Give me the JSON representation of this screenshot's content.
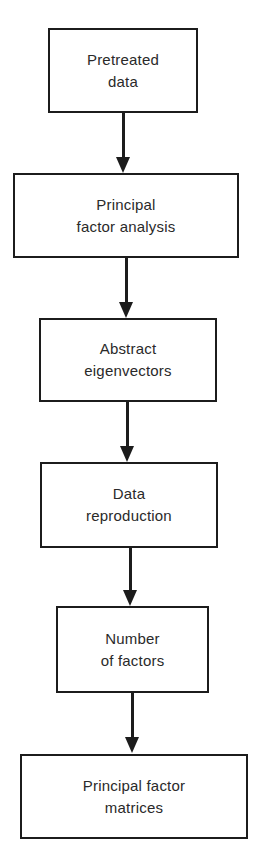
{
  "diagram": {
    "type": "flowchart",
    "direction": "top-to-bottom",
    "colors": {
      "stroke": "#1c1c1c",
      "text": "#2a2a2a",
      "background": "#ffffff"
    },
    "nodes": [
      {
        "id": "pretreated-data",
        "label": "Pretreated\ndata"
      },
      {
        "id": "principal-factor-analysis",
        "label": "Principal\nfactor analysis"
      },
      {
        "id": "abstract-eigenvectors",
        "label": "Abstract\neigenvectors"
      },
      {
        "id": "data-reproduction",
        "label": "Data\nreproduction"
      },
      {
        "id": "number-of-factors",
        "label": "Number\nof factors"
      },
      {
        "id": "principal-factor-matrices",
        "label": "Principal factor\nmatrices"
      }
    ],
    "edges": [
      {
        "from": "pretreated-data",
        "to": "principal-factor-analysis",
        "icon": "arrow-down-icon"
      },
      {
        "from": "principal-factor-analysis",
        "to": "abstract-eigenvectors",
        "icon": "arrow-down-icon"
      },
      {
        "from": "abstract-eigenvectors",
        "to": "data-reproduction",
        "icon": "arrow-down-icon"
      },
      {
        "from": "data-reproduction",
        "to": "number-of-factors",
        "icon": "arrow-down-icon"
      },
      {
        "from": "number-of-factors",
        "to": "principal-factor-matrices",
        "icon": "arrow-down-icon"
      }
    ]
  }
}
